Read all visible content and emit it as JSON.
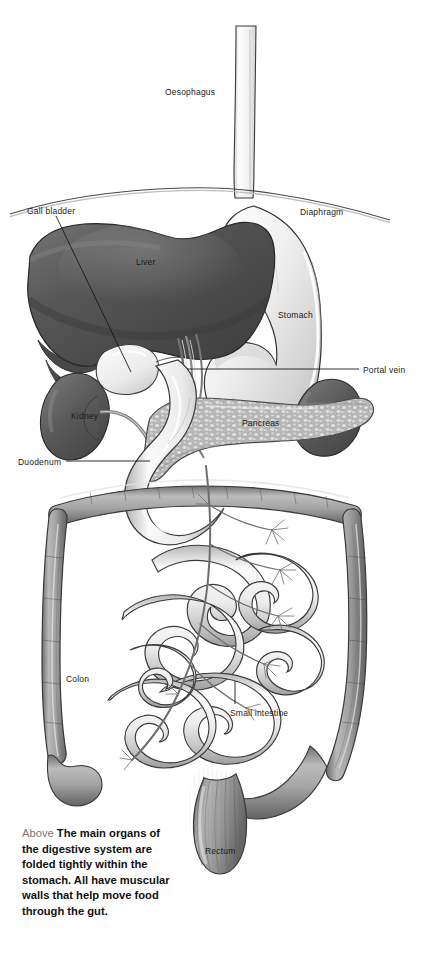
{
  "figure": {
    "title": "The main organs of the digestive system",
    "type": "anatomical-illustration",
    "style": "grayscale airbrush medical illustration",
    "background_color": "#ffffff"
  },
  "labels": [
    {
      "id": "oesophagus",
      "text": "Oesophagus",
      "x": 165,
      "y": 88,
      "leader": false
    },
    {
      "id": "gall-bladder",
      "text": "Gall bladder",
      "x": 27,
      "y": 207,
      "leader": true
    },
    {
      "id": "diaphragm",
      "text": "Diaphragm",
      "x": 300,
      "y": 208,
      "leader": false
    },
    {
      "id": "liver",
      "text": "Liver",
      "x": 136,
      "y": 258,
      "leader": false
    },
    {
      "id": "stomach",
      "text": "Stomach",
      "x": 278,
      "y": 311,
      "leader": false
    },
    {
      "id": "portal-vein",
      "text": "Portal vein",
      "x": 363,
      "y": 366,
      "leader": true
    },
    {
      "id": "kidney",
      "text": "Kidney",
      "x": 71,
      "y": 412,
      "leader": false
    },
    {
      "id": "pancreas",
      "text": "Pancreas",
      "x": 242,
      "y": 419,
      "leader": false
    },
    {
      "id": "duodenum",
      "text": "Duodenum",
      "x": 18,
      "y": 458,
      "leader": true
    },
    {
      "id": "colon",
      "text": "Colon",
      "x": 66,
      "y": 675,
      "leader": false
    },
    {
      "id": "small-intestine",
      "text": "Small intestine",
      "x": 230,
      "y": 709,
      "leader": true
    },
    {
      "id": "rectum",
      "text": "Rectum",
      "x": 205,
      "y": 847,
      "leader": false
    }
  ],
  "caption": {
    "lead_word": "Above",
    "body": "The main organs of the digestive system are folded tightly within the stomach. All have muscular walls that help move food through the gut."
  },
  "colors": {
    "liver_dark": "#4e4e4e",
    "liver_mid": "#5f5f5f",
    "liver_light": "#8a8a8a",
    "kidney_dark": "#4a4a4a",
    "kidney_mid": "#6b6b6b",
    "stomach_light": "#f4f4f4",
    "stomach_shade": "#cfcfcf",
    "pancreas_mid": "#bcbcbc",
    "pancreas_cell": "#e3e3e3",
    "intestine_light": "#f7f7f7",
    "intestine_shade": "#b4b4b4",
    "colon_dark": "#8d8d8d",
    "colon_shade": "#6a6a6a",
    "outline": "#2b2b2b",
    "label_text": "#1a1a1a",
    "caption_text": "#111111",
    "caption_lead": "#777777"
  }
}
